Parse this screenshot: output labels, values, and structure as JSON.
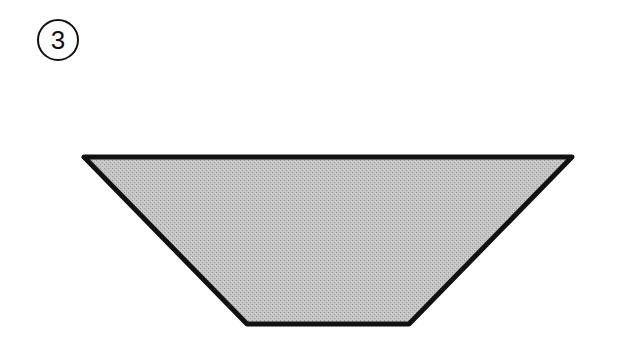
{
  "figure": {
    "label": "3",
    "label_style": "circled-number"
  },
  "shape": {
    "type": "trapezoid",
    "orientation": "inverted",
    "vertices": {
      "top_left": [
        84,
        157
      ],
      "top_right": [
        572,
        157
      ],
      "bottom_right": [
        409,
        324
      ],
      "bottom_left": [
        247,
        324
      ]
    },
    "fill": "#bdbdbd",
    "stroke": "#111111",
    "stroke_width": 5
  },
  "colors": {
    "background": "#ffffff",
    "outline": "#111111",
    "fill": "#bdbdbd"
  }
}
